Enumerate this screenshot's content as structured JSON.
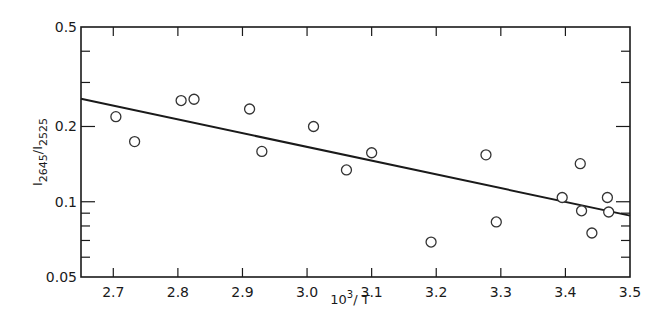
{
  "chart_data": {
    "type": "scatter",
    "title": "",
    "xlabel": "10³/T",
    "xlabel_base": "10",
    "xlabel_sup": "3",
    "xlabel_rest": "/ T",
    "ylabel": "I2645/I2525",
    "ylabel_parts": {
      "i1": "I",
      "sub1": "2645",
      "slash": "/",
      "i2": "I",
      "sub2": "2525"
    },
    "xlim": [
      2.65,
      3.5
    ],
    "ylim": [
      0.05,
      0.5
    ],
    "yscale": "log",
    "x_ticks": [
      "2.7",
      "2.8",
      "2.9",
      "3.0",
      "3.1",
      "3.2",
      "3.3",
      "3.4",
      "3.5"
    ],
    "x_tick_values": [
      2.7,
      2.8,
      2.9,
      3.0,
      3.1,
      3.2,
      3.3,
      3.4,
      3.5
    ],
    "y_ticks": [
      "0.05",
      "0.1",
      "0.2",
      "0.5"
    ],
    "y_tick_values": [
      0.05,
      0.1,
      0.2,
      0.5
    ],
    "grid": false,
    "legend": null,
    "series": [
      {
        "name": "data",
        "marker": "open-circle",
        "x": [
          2.704,
          2.733,
          2.805,
          2.825,
          2.911,
          2.93,
          3.01,
          3.061,
          3.1,
          3.192,
          3.277,
          3.293,
          3.395,
          3.423,
          3.425,
          3.441,
          3.465,
          3.467
        ],
        "y": [
          0.219,
          0.174,
          0.254,
          0.257,
          0.235,
          0.159,
          0.2,
          0.134,
          0.157,
          0.069,
          0.154,
          0.083,
          0.104,
          0.142,
          0.092,
          0.075,
          0.104,
          0.091
        ]
      },
      {
        "name": "fit",
        "type": "line",
        "x": [
          2.65,
          3.5
        ],
        "y": [
          0.258,
          0.088
        ]
      }
    ]
  }
}
